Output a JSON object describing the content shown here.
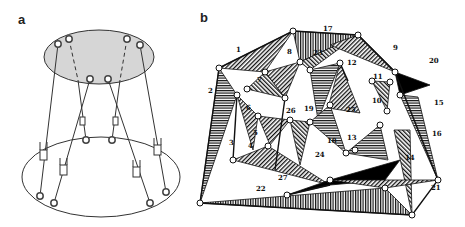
{
  "figure": {
    "panels": [
      {
        "label": "a",
        "description": "Stewart platform: upper elliptical plate (gray) connected to lower elliptical base by six telescopic legs with joints"
      },
      {
        "label": "b",
        "description": "Tensegrity / polyhedral structure composed of hatched triangular faces with numbered nodes/members",
        "member_labels": [
          "1",
          "2",
          "3",
          "4",
          "5",
          "6",
          "7",
          "8",
          "9",
          "10",
          "11",
          "12",
          "13",
          "14",
          "15",
          "16",
          "17",
          "18",
          "19",
          "20",
          "21",
          "22",
          "23",
          "24",
          "25",
          "26",
          "27"
        ]
      }
    ]
  },
  "panel_a": {
    "label": "a"
  },
  "panel_b": {
    "label": "b",
    "labels": {
      "l1": "1",
      "l2": "2",
      "l3": "3",
      "l4": "4",
      "l5": "5",
      "l6": "6",
      "l7": "7",
      "l8": "8",
      "l9": "9",
      "l10": "10",
      "l11": "11",
      "l12": "12",
      "l13": "13",
      "l14": "14",
      "l15": "15",
      "l16": "16",
      "l17": "17",
      "l18": "18",
      "l19": "19",
      "l20": "20",
      "l21": "21",
      "l22": "22",
      "l23": "23",
      "l24": "24",
      "l25": "25",
      "l26": "26",
      "l27": "27"
    }
  },
  "colors": {
    "plate": "#d4d4d4",
    "line": "#222222",
    "black_fill": "#000000"
  }
}
